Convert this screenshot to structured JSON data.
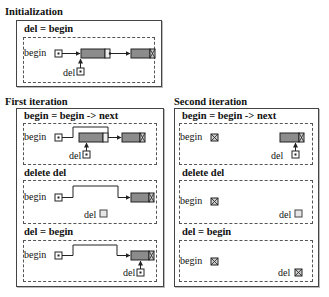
{
  "sections": {
    "initialization": {
      "heading": "Initialization",
      "steps": [
        {
          "title": "del = begin",
          "begin_label": "begin",
          "del_label": "del"
        }
      ]
    },
    "first_iteration": {
      "heading": "First iteration",
      "steps": [
        {
          "title": "begin = begin -> next",
          "begin_label": "begin",
          "del_label": "del"
        },
        {
          "title": "delete del",
          "begin_label": "begin",
          "del_label": "del"
        },
        {
          "title": "del = begin",
          "begin_label": "begin",
          "del_label": "del"
        }
      ]
    },
    "second_iteration": {
      "heading": "Second iteration",
      "steps": [
        {
          "title": "begin = begin -> next",
          "begin_label": "begin",
          "del_label": "del"
        },
        {
          "title": "delete del",
          "begin_label": "begin",
          "del_label": "del"
        },
        {
          "title": "del = begin",
          "begin_label": "begin",
          "del_label": "del"
        }
      ]
    }
  },
  "colors": {
    "node_fill": "#8c8c8c",
    "line": "#222222",
    "panel_border": "#555555"
  },
  "icons": {
    "pointer": "filled-dot-box",
    "null_pointer": "x-box",
    "dangling_pointer": "empty-box"
  }
}
